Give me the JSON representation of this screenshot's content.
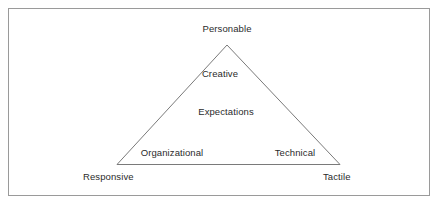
{
  "figure": {
    "type": "triangle-concept-diagram",
    "background_color": "#ffffff",
    "frame_border_color": "#9a9a9a",
    "line_color": "#7a7a7a",
    "text_color": "#2b2b2b",
    "apex_label": "Personable",
    "inner_labels": [
      "Creative",
      "Expectations"
    ],
    "base_inner_labels": [
      "Organizational",
      "Technical"
    ],
    "base_outer_labels": [
      "Responsive",
      "Tactile"
    ],
    "labels": {
      "personable": "Personable",
      "creative": "Creative",
      "expectations": "Expectations",
      "organizational": "Organizational",
      "technical": "Technical",
      "responsive": "Responsive",
      "tactile": "Tactile"
    }
  }
}
